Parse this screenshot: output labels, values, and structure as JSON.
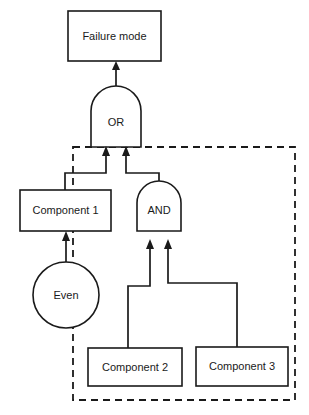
{
  "diagram": {
    "type": "fault-tree",
    "title_node": {
      "label": "Failure mode"
    },
    "gates": [
      {
        "id": "or-gate",
        "label": "OR",
        "shape": "d-shape"
      },
      {
        "id": "and-gate",
        "label": "AND",
        "shape": "d-shape"
      }
    ],
    "components": [
      {
        "id": "component-1",
        "label": "Component 1"
      },
      {
        "id": "component-2",
        "label": "Component 2"
      },
      {
        "id": "component-3",
        "label": "Component 3"
      }
    ],
    "basic_events": [
      {
        "id": "event-circle",
        "label": "Even"
      }
    ],
    "boundary": {
      "style": "dashed",
      "label": ""
    },
    "colors": {
      "stroke": "#1a1a1a",
      "fill": "#ffffff",
      "background": "#ffffff"
    }
  }
}
